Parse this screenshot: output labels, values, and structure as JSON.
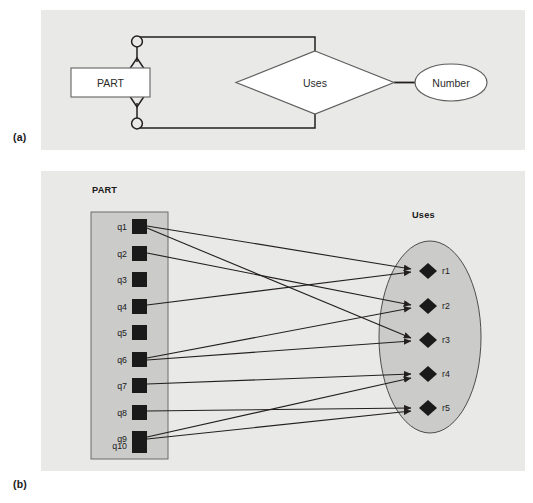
{
  "figure": {
    "panel_labels": {
      "a": "(a)",
      "b": "(b)"
    },
    "background_color": "#e9e9e7",
    "page_background": "#ffffff",
    "line_color": "#231f20",
    "node_fill": "#1a1a1a"
  },
  "panel_a": {
    "type": "er-diagram",
    "entity": {
      "name": "PART",
      "shape": "rectangle",
      "fill": "#ffffff"
    },
    "relationship": {
      "name": "Uses",
      "shape": "diamond",
      "fill": "#ffffff"
    },
    "attribute": {
      "name": "Number",
      "shape": "ellipse",
      "fill": "#ffffff"
    },
    "cardinality_markers": [
      {
        "name": "optional-zero-marker-top",
        "glyph": "circle"
      },
      {
        "name": "many-crowsfoot-top",
        "glyph": "arrow-triangle-up"
      },
      {
        "name": "many-crowsfoot-bottom",
        "glyph": "arrow-triangle-down"
      },
      {
        "name": "optional-zero-marker-bottom",
        "glyph": "circle"
      }
    ]
  },
  "panel_b": {
    "type": "instance-diagram",
    "left_set": {
      "title": "PART",
      "shape": "rectangle",
      "fill": "#cccccb",
      "members": [
        "q1",
        "q2",
        "q3",
        "q4",
        "q5",
        "q6",
        "q7",
        "q8",
        "q9",
        "q10"
      ],
      "member_glyph": "filled-square"
    },
    "right_set": {
      "title": "Uses",
      "shape": "ellipse",
      "fill": "#cccccb",
      "members": [
        "r1",
        "r2",
        "r3",
        "r4",
        "r5"
      ],
      "member_glyph": "filled-diamond"
    },
    "edges": [
      {
        "from": "q1",
        "to": "r1"
      },
      {
        "from": "q1",
        "to": "r3"
      },
      {
        "from": "q2",
        "to": "r2"
      },
      {
        "from": "q4",
        "to": "r1"
      },
      {
        "from": "q6",
        "to": "r2"
      },
      {
        "from": "q6",
        "to": "r3"
      },
      {
        "from": "q7",
        "to": "r4"
      },
      {
        "from": "q8",
        "to": "r5"
      },
      {
        "from": "q9",
        "to": "r4"
      },
      {
        "from": "q9",
        "to": "r5"
      }
    ],
    "edge_arrowhead": "solid-triangle"
  }
}
